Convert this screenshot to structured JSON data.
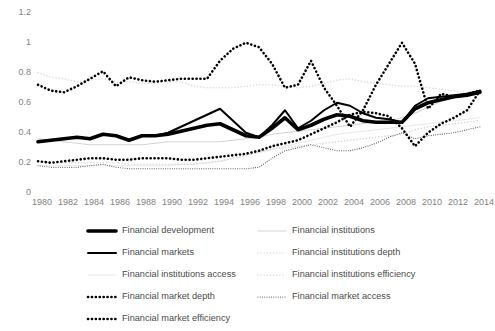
{
  "chart_data": {
    "type": "line",
    "title": "",
    "subtitle": "",
    "xlabel": "",
    "ylabel": "",
    "xlim": [
      1980,
      2014
    ],
    "ylim": [
      0,
      1.2
    ],
    "yticks": [
      "0",
      "0.2",
      "0.4",
      "0.6",
      "0.8",
      "1",
      "1.2"
    ],
    "ytick_values": [
      0,
      0.2,
      0.4,
      0.6,
      0.8,
      1,
      1.2
    ],
    "xticks": [
      "1980",
      "1982",
      "1984",
      "1986",
      "1988",
      "1990",
      "1992",
      "1994",
      "1996",
      "1998",
      "2000",
      "2002",
      "2004",
      "2006",
      "2008",
      "2010",
      "2012",
      "2014"
    ],
    "xtick_values": [
      1980,
      1982,
      1984,
      1986,
      1988,
      1990,
      1992,
      1994,
      1996,
      1998,
      2000,
      2002,
      2004,
      2006,
      2008,
      2010,
      2012,
      2014
    ],
    "x": [
      1980,
      1981,
      1982,
      1983,
      1984,
      1985,
      1986,
      1987,
      1988,
      1989,
      1990,
      1991,
      1992,
      1993,
      1994,
      1995,
      1996,
      1997,
      1998,
      1999,
      2000,
      2001,
      2002,
      2003,
      2004,
      2005,
      2006,
      2007,
      2008,
      2009,
      2010,
      2011,
      2012,
      2013,
      2014
    ],
    "grid": false,
    "legend_position": "bottom",
    "series": [
      {
        "name": "Financial development",
        "key": "financial_development",
        "style": "solid",
        "width": 3.6,
        "color": "#000000",
        "values": [
          0.335,
          0.345,
          0.355,
          0.365,
          0.355,
          0.385,
          0.375,
          0.345,
          0.375,
          0.375,
          0.385,
          0.405,
          0.425,
          0.445,
          0.455,
          0.415,
          0.375,
          0.365,
          0.425,
          0.495,
          0.415,
          0.445,
          0.485,
          0.515,
          0.505,
          0.475,
          0.465,
          0.465,
          0.465,
          0.555,
          0.595,
          0.615,
          0.635,
          0.645,
          0.665
        ]
      },
      {
        "name": "Financial markets",
        "key": "financial_markets",
        "style": "solid",
        "width": 2.0,
        "color": "#000000",
        "values": [
          0.335,
          0.345,
          0.355,
          0.365,
          0.355,
          0.385,
          0.375,
          0.345,
          0.375,
          0.375,
          0.395,
          0.435,
          0.475,
          0.515,
          0.555,
          0.475,
          0.395,
          0.365,
          0.445,
          0.545,
          0.425,
          0.475,
          0.545,
          0.595,
          0.575,
          0.525,
          0.495,
          0.485,
          0.465,
          0.575,
          0.625,
          0.635,
          0.645,
          0.655,
          0.675
        ]
      },
      {
        "name": "Financial institutions access",
        "key": "financial_institutions_access",
        "style": "solid",
        "width": 1.0,
        "color": "#e8e8e8",
        "values": [
          0.175,
          0.175,
          0.175,
          0.175,
          0.175,
          0.175,
          0.175,
          0.175,
          0.175,
          0.175,
          0.175,
          0.185,
          0.185,
          0.195,
          0.205,
          0.225,
          0.245,
          0.265,
          0.285,
          0.305,
          0.325,
          0.345,
          0.365,
          0.385,
          0.395,
          0.405,
          0.415,
          0.425,
          0.435,
          0.445,
          0.455,
          0.465,
          0.475,
          0.485,
          0.495
        ]
      },
      {
        "name": "Financial market depth",
        "key": "financial_market_depth",
        "style": "dotted-thick",
        "width": 2.6,
        "color": "#000000",
        "values": [
          0.205,
          0.195,
          0.205,
          0.215,
          0.225,
          0.225,
          0.215,
          0.215,
          0.225,
          0.225,
          0.225,
          0.215,
          0.215,
          0.225,
          0.235,
          0.245,
          0.255,
          0.275,
          0.305,
          0.325,
          0.345,
          0.385,
          0.425,
          0.465,
          0.515,
          0.535,
          0.525,
          0.505,
          0.425,
          0.305,
          0.395,
          0.455,
          0.495,
          0.545,
          0.675
        ]
      },
      {
        "name": "Financial market efficiency",
        "key": "financial_market_efficiency",
        "style": "dotted-thick",
        "width": 2.6,
        "color": "#000000",
        "values": [
          0.715,
          0.675,
          0.665,
          0.705,
          0.755,
          0.805,
          0.705,
          0.765,
          0.745,
          0.735,
          0.745,
          0.755,
          0.755,
          0.755,
          0.875,
          0.955,
          0.995,
          0.965,
          0.855,
          0.695,
          0.715,
          0.875,
          0.695,
          0.575,
          0.435,
          0.545,
          0.715,
          0.855,
          0.995,
          0.855,
          0.555,
          0.655,
          0.635,
          0.655,
          0.675
        ]
      },
      {
        "name": "Financial institutions",
        "key": "financial_institutions",
        "style": "solid",
        "width": 1.2,
        "color": "#d4d4d4",
        "values": [
          0.355,
          0.345,
          0.335,
          0.325,
          0.315,
          0.315,
          0.315,
          0.315,
          0.315,
          0.325,
          0.335,
          0.335,
          0.335,
          0.335,
          0.335,
          0.345,
          0.355,
          0.365,
          0.385,
          0.395,
          0.405,
          0.415,
          0.425,
          0.435,
          0.445,
          0.455,
          0.465,
          0.475,
          0.495,
          0.525,
          0.565,
          0.605,
          0.635,
          0.655,
          0.665
        ]
      },
      {
        "name": "Financial institutions depth",
        "key": "financial_institutions_depth",
        "style": "dotted-light",
        "width": 1.6,
        "color": "#dcdcdc",
        "values": [
          0.795,
          0.765,
          0.755,
          0.735,
          0.745,
          0.755,
          0.735,
          0.735,
          0.725,
          0.725,
          0.735,
          0.735,
          0.705,
          0.695,
          0.695,
          0.695,
          0.705,
          0.715,
          0.715,
          0.705,
          0.695,
          0.705,
          0.725,
          0.745,
          0.755,
          0.735,
          0.725,
          0.715,
          0.705,
          0.705,
          0.695,
          0.685,
          0.675,
          0.665,
          0.655
        ]
      },
      {
        "name": "Financial institutions efficiency",
        "key": "financial_institutions_efficiency",
        "style": "dotted-light",
        "width": 1.6,
        "color": "#d8d8d8",
        "values": [
          0.205,
          0.195,
          0.195,
          0.195,
          0.195,
          0.195,
          0.195,
          0.185,
          0.185,
          0.185,
          0.185,
          0.185,
          0.185,
          0.195,
          0.205,
          0.225,
          0.245,
          0.265,
          0.285,
          0.295,
          0.305,
          0.315,
          0.325,
          0.335,
          0.345,
          0.355,
          0.365,
          0.375,
          0.385,
          0.415,
          0.435,
          0.445,
          0.455,
          0.465,
          0.475
        ]
      },
      {
        "name": "Financial market access",
        "key": "financial_market_access",
        "style": "dotted-fine",
        "width": 1.1,
        "color": "#4d4d4d",
        "values": [
          0.175,
          0.165,
          0.165,
          0.165,
          0.175,
          0.185,
          0.165,
          0.155,
          0.155,
          0.155,
          0.155,
          0.155,
          0.155,
          0.155,
          0.155,
          0.155,
          0.155,
          0.165,
          0.225,
          0.275,
          0.295,
          0.315,
          0.295,
          0.275,
          0.275,
          0.295,
          0.325,
          0.365,
          0.395,
          0.355,
          0.375,
          0.385,
          0.395,
          0.415,
          0.435
        ]
      }
    ]
  },
  "legend": {
    "column_left": [
      {
        "label": "Financial development",
        "key": "financial_development"
      },
      {
        "label": "Financial markets",
        "key": "financial_markets"
      },
      {
        "label": "Financial institutions access",
        "key": "financial_institutions_access"
      },
      {
        "label": "Financial market depth",
        "key": "financial_market_depth"
      },
      {
        "label": "Financial market efficiency",
        "key": "financial_market_efficiency"
      }
    ],
    "column_right": [
      {
        "label": "Financial institutions",
        "key": "financial_institutions"
      },
      {
        "label": "Financial institutions depth",
        "key": "financial_institutions_depth"
      },
      {
        "label": "Financial institutions efficiency",
        "key": "financial_institutions_efficiency"
      },
      {
        "label": "Financial market access",
        "key": "financial_market_access"
      }
    ]
  },
  "colors": {
    "axis_text": "#7f7f7f",
    "legend_text": "#4a4a4a",
    "background": "#ffffff"
  }
}
